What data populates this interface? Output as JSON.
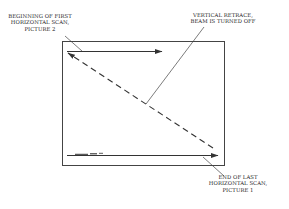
{
  "diagram": {
    "type": "raster-scan-frame",
    "colors": {
      "line": "#333333",
      "background": "#ffffff"
    },
    "labels": {
      "beginning_first_scan": {
        "line1": "BEGINNING OF FIRST",
        "line2": "HORIZONTAL SCAN,",
        "line3": "PICTURE 2"
      },
      "vertical_retrace": {
        "line1": "VERTICAL RETRACE,",
        "line2": "BEAM IS TURNED OFF"
      },
      "end_last_scan": {
        "line1": "END OF LAST",
        "line2": "HORIZONTAL SCAN,",
        "line3": "PICTURE 1"
      }
    },
    "elements": [
      {
        "name": "screen-frame",
        "shape": "rectangle"
      },
      {
        "name": "first-horizontal-scan",
        "shape": "solid-arrow",
        "direction": "left-to-right"
      },
      {
        "name": "vertical-retrace",
        "shape": "dashed-arrow",
        "direction": "bottom-right-to-top-left"
      },
      {
        "name": "last-horizontal-scan",
        "shape": "solid-arrow",
        "direction": "left-to-right"
      }
    ]
  }
}
